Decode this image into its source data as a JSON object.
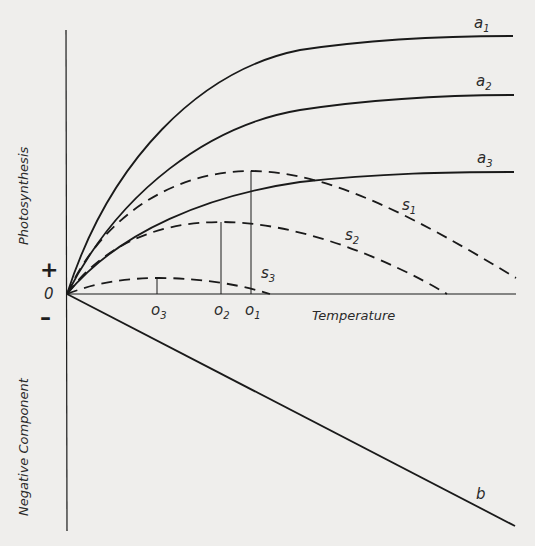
{
  "diagram": {
    "axes": {
      "y_label_positive": "Photosynthesis",
      "y_label_negative": "Negative   Component",
      "x_label": "Temperature",
      "origin_label": "0",
      "plus_sign": "+",
      "minus_sign": "–"
    },
    "curves": {
      "a1": {
        "letter": "a",
        "sub": "1",
        "style": "solid"
      },
      "a2": {
        "letter": "a",
        "sub": "2",
        "style": "solid"
      },
      "a3": {
        "letter": "a",
        "sub": "3",
        "style": "solid"
      },
      "s1": {
        "letter": "s",
        "sub": "1",
        "style": "dashed"
      },
      "s2": {
        "letter": "s",
        "sub": "2",
        "style": "dashed"
      },
      "s3": {
        "letter": "s",
        "sub": "3",
        "style": "dashed"
      },
      "b": {
        "letter": "b",
        "style": "solid"
      }
    },
    "optima": [
      {
        "letter": "o",
        "sub": "3"
      },
      {
        "letter": "o",
        "sub": "2"
      },
      {
        "letter": "o",
        "sub": "1"
      }
    ],
    "colors": {
      "line": "#1a1a1a",
      "background": "#efeeec"
    }
  }
}
